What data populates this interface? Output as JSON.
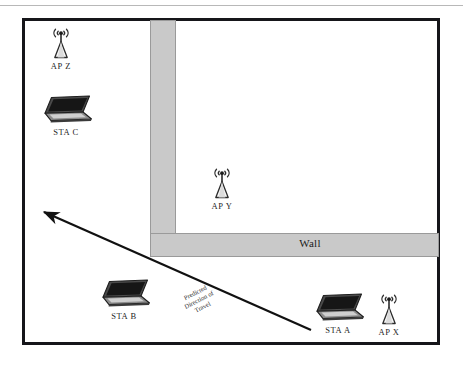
{
  "diagram": {
    "wall_label": "Wall",
    "travel_label_lines": [
      "Predicted",
      "Direction of",
      "Travel"
    ],
    "colors": {
      "border": "#16161a",
      "wall_fill": "#c9c9c9",
      "wall_stroke": "#9a9a9a",
      "arrow": "#111111",
      "icon_dark": "#2b2b2b",
      "icon_mid": "#6e6e6e",
      "icon_light": "#d6d6d6",
      "background": "#ffffff"
    },
    "access_points": [
      {
        "id": "ap-z",
        "label": "AP Z",
        "x": 48,
        "y": 26,
        "icon": "access-point-icon"
      },
      {
        "id": "ap-y",
        "label": "AP Y",
        "x": 209,
        "y": 166,
        "icon": "access-point-icon"
      },
      {
        "id": "ap-x",
        "label": "AP X",
        "x": 376,
        "y": 292,
        "icon": "access-point-icon"
      }
    ],
    "stations": [
      {
        "id": "sta-c",
        "label": "STA C",
        "x": 36,
        "y": 94,
        "icon": "laptop-icon"
      },
      {
        "id": "sta-b",
        "label": "STA B",
        "x": 94,
        "y": 278,
        "icon": "laptop-icon"
      },
      {
        "id": "sta-a",
        "label": "STA A",
        "x": 308,
        "y": 292,
        "icon": "laptop-icon"
      }
    ],
    "arrow": {
      "name": "predicted-direction-arrow",
      "from_x": 311,
      "from_y": 330,
      "to_x": 40,
      "to_y": 211
    }
  }
}
